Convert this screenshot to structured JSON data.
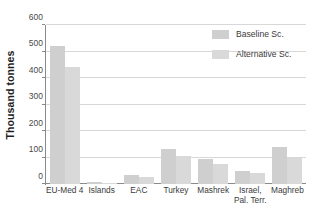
{
  "chart_data": {
    "type": "bar",
    "title": "",
    "xlabel": "",
    "ylabel": "Thousand tonnes",
    "ylim": [
      0,
      600
    ],
    "yticks": [
      0,
      100,
      200,
      300,
      400,
      500,
      600
    ],
    "ytick_labels": [
      "0",
      "100",
      "200",
      "300",
      "400",
      "500",
      "600"
    ],
    "grid": true,
    "legend_position": "top-right",
    "categories": [
      "EU-Med 4",
      "Islands",
      "EAC",
      "Turkey",
      "Mashrek",
      "Israel, Pal. Terr.",
      "Maghreb"
    ],
    "category_lines": [
      [
        "EU-Med 4",
        ""
      ],
      [
        "Islands",
        ""
      ],
      [
        "EAC",
        ""
      ],
      [
        "Turkey",
        ""
      ],
      [
        "Mashrek",
        ""
      ],
      [
        "Israel,",
        "Pal. Terr."
      ],
      [
        "Maghreb",
        ""
      ]
    ],
    "series": [
      {
        "name": "Baseline Sc.",
        "color": "#cfcfcf",
        "values": [
          520,
          7,
          35,
          133,
          95,
          48,
          140
        ]
      },
      {
        "name": "Alternative Sc.",
        "color": "#d9d9d9",
        "values": [
          440,
          3,
          25,
          107,
          74,
          41,
          100
        ]
      }
    ]
  },
  "legend": {
    "items": [
      {
        "label": "Baseline Sc."
      },
      {
        "label": "Alternative Sc."
      }
    ]
  },
  "axes": {
    "y_title": "Thousand tonnes"
  }
}
